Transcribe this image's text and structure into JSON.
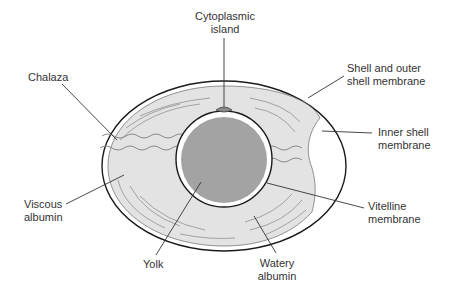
{
  "diagram": {
    "type": "egg-structure",
    "colors": {
      "shell_outline": "#1a1a1a",
      "albumen_fill": "#e3e3e3",
      "yolk_fill": "#a3a3a3",
      "chalaza_stroke": "#8a8a8a",
      "leader_line": "#333333",
      "text": "#333333"
    },
    "labels": {
      "cytoplasmic_island": "Cytoplasmic\nisland",
      "shell_outer_membrane": "Shell and outer\nshell membrane",
      "chalaza": "Chalaza",
      "inner_shell_membrane": "Inner shell\nmembrane",
      "viscous_albumin": "Viscous\nalbumin",
      "vitelline_membrane": "Vitelline\nmembrane",
      "yolk": "Yolk",
      "watery_albumin": "Watery\nalbumin"
    }
  }
}
